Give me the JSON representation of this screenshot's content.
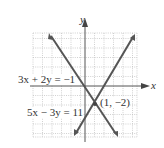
{
  "figure": {
    "axis_labels": {
      "x": "x",
      "y": "y"
    },
    "equations": [
      {
        "label": "3x + 2y = −1",
        "a": 3,
        "b": 2,
        "c": -1
      },
      {
        "label": "5x − 3y = 11",
        "a": 5,
        "b": -3,
        "c": 11
      }
    ],
    "intersection": {
      "label": "(1, −2)",
      "x": 1,
      "y": -2
    },
    "colors": {
      "line": "#555555",
      "axis": "#555555",
      "grid": "#bbbbbb"
    }
  }
}
